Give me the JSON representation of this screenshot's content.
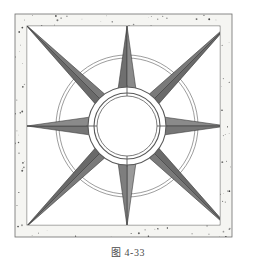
{
  "figure": {
    "caption": "图 4-33",
    "caption_label": "figure-number",
    "background": "#ffffff"
  },
  "frame": {
    "outer_rect": {
      "x": 15,
      "y": 14,
      "w": 217,
      "h": 223
    },
    "inner_rect": {
      "x": 27,
      "y": 26,
      "w": 193,
      "h": 199
    },
    "border_fill": "#f5f5f2",
    "border_stroke": "#6d6d6d",
    "speckle_color": "#2b2b2b",
    "speckle_count": 520,
    "band_thickness": 12
  },
  "rosette": {
    "center": {
      "cx": 127,
      "cy": 126
    },
    "outer_circle_r": 71,
    "outer_circle_r2": 68,
    "mid_ring_r": 39,
    "inner_ring_r": 33,
    "hub_r": 30,
    "tick_count": 4,
    "tick_inner_r": 30,
    "tick_outer_r": 41,
    "ring_stroke": "#5a5a5a",
    "hub_fill": "#ffffff",
    "points": [
      {
        "name": "point-north",
        "angle_deg": 270,
        "tip_r": 100,
        "half_width_deg": 13,
        "fill_left": "#6f6f6f",
        "fill_right": "#8a8a8a",
        "kind": "cardinal"
      },
      {
        "name": "point-northeast",
        "angle_deg": 315,
        "tip_r": 146,
        "half_width_deg": 10,
        "fill_left": "#7a7a7a",
        "fill_right": "#6a6a6a",
        "kind": "diagonal"
      },
      {
        "name": "point-east",
        "angle_deg": 0,
        "tip_r": 100,
        "half_width_deg": 13,
        "fill_left": "#8a8a8a",
        "fill_right": "#767676",
        "kind": "cardinal"
      },
      {
        "name": "point-southeast",
        "angle_deg": 45,
        "tip_r": 146,
        "half_width_deg": 10,
        "fill_left": "#6a6a6a",
        "fill_right": "#7a7a7a",
        "kind": "diagonal"
      },
      {
        "name": "point-south",
        "angle_deg": 90,
        "tip_r": 100,
        "half_width_deg": 13,
        "fill_left": "#9a9a9a",
        "fill_right": "#7e7e7e",
        "kind": "cardinal"
      },
      {
        "name": "point-southwest",
        "angle_deg": 135,
        "tip_r": 146,
        "half_width_deg": 10,
        "fill_left": "#7a7a7a",
        "fill_right": "#6a6a6a",
        "kind": "diagonal"
      },
      {
        "name": "point-west",
        "angle_deg": 180,
        "tip_r": 100,
        "half_width_deg": 13,
        "fill_left": "#767676",
        "fill_right": "#8a8a8a",
        "kind": "cardinal"
      },
      {
        "name": "point-northwest",
        "angle_deg": 225,
        "tip_r": 146,
        "half_width_deg": 10,
        "fill_left": "#6a6a6a",
        "fill_right": "#7a7a7a",
        "kind": "diagonal"
      }
    ],
    "point_stroke": "#3c3c3c"
  },
  "colors": {
    "line": "#5a5a5a",
    "dark_gray": "#6a6a6a",
    "mid_gray": "#7a7a7a",
    "light_gray": "#9a9a9a",
    "paper": "#ffffff",
    "caption_text": "#4a4a4a"
  }
}
